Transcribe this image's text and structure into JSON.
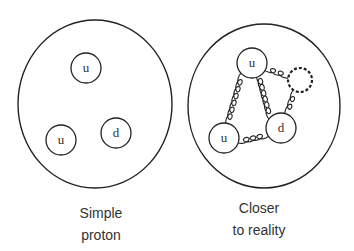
{
  "diagram": {
    "panels": [
      {
        "label_line1": "Simple",
        "label_line2": "proton",
        "quarks": [
          {
            "flavor": "u",
            "position": "top"
          },
          {
            "flavor": "u",
            "position": "bottom-left"
          },
          {
            "flavor": "d",
            "position": "bottom-right"
          }
        ]
      },
      {
        "label_line1": "Closer",
        "label_line2": "to reality",
        "quarks": [
          {
            "flavor": "u",
            "position": "top"
          },
          {
            "flavor": "u",
            "position": "bottom-left"
          },
          {
            "flavor": "d",
            "position": "bottom-right"
          }
        ],
        "gluons": [
          "u-top to u-bottom",
          "u-top to d",
          "u-bottom to d",
          "u-top to gluon-loop",
          "gluon-loop to d"
        ],
        "gluon_loop": "dashed circle"
      }
    ],
    "colors": {
      "stroke": "#222222",
      "background": "#ffffff"
    }
  }
}
